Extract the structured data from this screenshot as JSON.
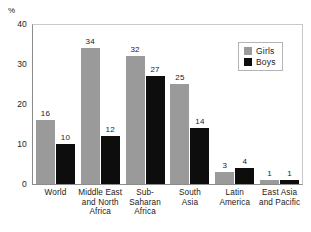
{
  "chart_data": {
    "type": "bar",
    "title": "",
    "xlabel": "",
    "ylabel": "%",
    "ylim": [
      0,
      40
    ],
    "yticks": [
      0,
      10,
      20,
      30,
      40
    ],
    "grid": false,
    "legend_position": "top-right",
    "categories": [
      "World",
      "Middle East and North Africa",
      "Sub-Saharan Africa",
      "South Asia",
      "Latin America",
      "East Asia and Pacific"
    ],
    "category_lines": [
      [
        "World"
      ],
      [
        "Middle East",
        "and North",
        "Africa"
      ],
      [
        "Sub-",
        "Saharan",
        "Africa"
      ],
      [
        "South",
        "Asia"
      ],
      [
        "Latin",
        "America"
      ],
      [
        "East Asia",
        "and Pacific"
      ]
    ],
    "series": [
      {
        "name": "Girls",
        "color": "#9a9a9a",
        "values": [
          16,
          34,
          32,
          25,
          3,
          1
        ]
      },
      {
        "name": "Boys",
        "color": "#0d0d0d",
        "values": [
          10,
          12,
          27,
          14,
          4,
          1
        ]
      }
    ]
  },
  "axis": {
    "y_title": "%",
    "y_tick_labels": [
      "40",
      "30",
      "20",
      "10",
      "0"
    ]
  },
  "legend": {
    "items": [
      {
        "label": "Girls"
      },
      {
        "label": "Boys"
      }
    ]
  }
}
